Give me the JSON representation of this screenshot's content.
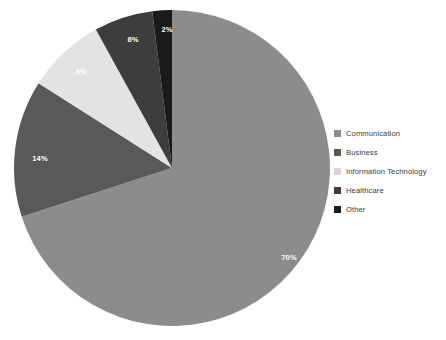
{
  "chart_data": {
    "type": "pie",
    "title": "",
    "categories": [
      "Communication",
      "Business",
      "Information Technology",
      "Healthcare",
      "Other"
    ],
    "values": [
      70,
      14,
      8,
      6,
      2
    ],
    "value_labels": [
      "70%",
      "14%",
      "8%",
      "6%",
      "2%"
    ],
    "unit": "%",
    "colors": [
      "#8c8c8c",
      "#595959",
      "#e3e3e3",
      "#3d3d3d",
      "#1a1a1a"
    ],
    "legend_position": "right",
    "grid": false,
    "start_angle_deg": 0,
    "direction": "clockwise",
    "slices": [
      {
        "label": "Communication",
        "value": 70,
        "display": "70%",
        "color": "#8c8c8c",
        "label_x": 277,
        "label_y": 250,
        "label_fill": "#ffffff"
      },
      {
        "label": "Business",
        "value": 14,
        "display": "14%",
        "color": "#595959",
        "label_x": 28,
        "label_y": 151,
        "label_fill": "#ffffff"
      },
      {
        "label": "Information Technology",
        "value": 8,
        "display": "8%",
        "color": "#e3e3e3",
        "label_x": 69,
        "label_y": 64,
        "label_fill": "#ffffff"
      },
      {
        "label": "Healthcare",
        "value": 6,
        "display": "6%",
        "color": "#3d3d3d",
        "label_x": 121,
        "label_y": 32,
        "label_fill": "#ffffff"
      },
      {
        "label": "Other",
        "value": 2,
        "display": "2%",
        "color": "#1a1a1a",
        "label_x": 155,
        "label_y": 22,
        "label_fill": "#ffffff"
      }
    ]
  },
  "legend": {
    "items": [
      {
        "label": "Communication",
        "color": "#8c8c8c"
      },
      {
        "label": "Business",
        "color": "#595959"
      },
      {
        "label": "Information Technology",
        "color": "#d4d4d4"
      },
      {
        "label": "Healthcare",
        "color": "#3d3d3d"
      },
      {
        "label": "Other",
        "color": "#1a1a1a"
      }
    ]
  },
  "caption": {
    "text": ""
  }
}
